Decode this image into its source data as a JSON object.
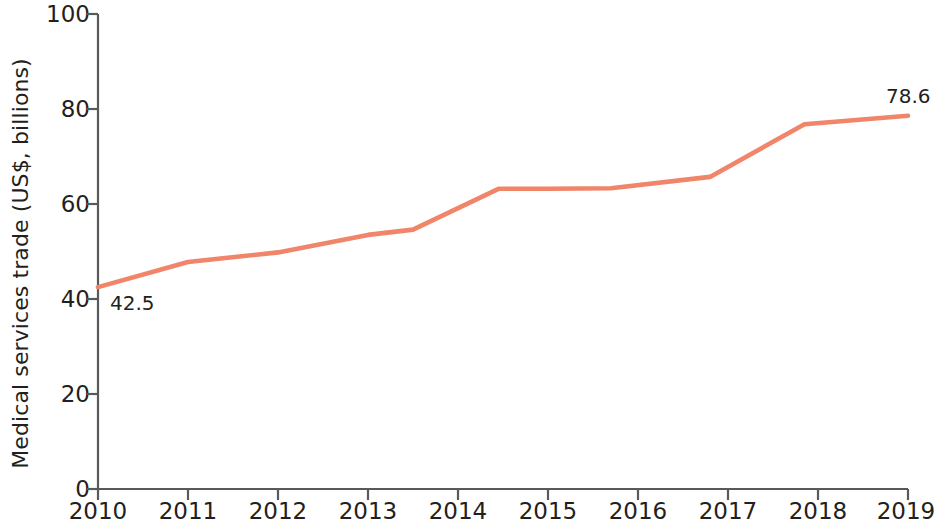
{
  "chart_data": {
    "type": "line",
    "title": "",
    "subtitle": "",
    "xlabel": "",
    "ylabel": "Medical services trade (US$, billions)",
    "x": [
      2010,
      2011,
      2012,
      2013,
      2014,
      2015,
      2016,
      2017,
      2018,
      2019
    ],
    "categories": [
      "2010",
      "2011",
      "2012",
      "2013",
      "2014",
      "2015",
      "2016",
      "2017",
      "2018",
      "2019"
    ],
    "values": [
      42.5,
      47.8,
      49.8,
      53.5,
      61.0,
      63.2,
      63.4,
      65.5,
      76.8,
      78.6
    ],
    "vertices": [
      {
        "x": 2010.0,
        "y": 42.5
      },
      {
        "x": 2011.0,
        "y": 47.8
      },
      {
        "x": 2012.0,
        "y": 49.8
      },
      {
        "x": 2013.0,
        "y": 53.5
      },
      {
        "x": 2013.5,
        "y": 54.6
      },
      {
        "x": 2014.45,
        "y": 63.2
      },
      {
        "x": 2015.0,
        "y": 63.2
      },
      {
        "x": 2015.7,
        "y": 63.3
      },
      {
        "x": 2016.8,
        "y": 65.7
      },
      {
        "x": 2017.85,
        "y": 76.8
      },
      {
        "x": 2019.0,
        "y": 78.6
      }
    ],
    "ylim": [
      0,
      100
    ],
    "xlim": [
      2010,
      2019
    ],
    "yticks": [
      0,
      20,
      40,
      60,
      80,
      100
    ],
    "ytick_labels": [
      "0",
      "20",
      "40",
      "60",
      "80",
      "100"
    ],
    "xticks": [
      2010,
      2011,
      2012,
      2013,
      2014,
      2015,
      2016,
      2017,
      2018,
      2019
    ],
    "xtick_labels": [
      "2010",
      "2011",
      "2012",
      "2013",
      "2014",
      "2015",
      "2016",
      "2017",
      "2018",
      "2019"
    ],
    "grid": false,
    "legend": null,
    "annotations": [
      {
        "text": "42.5",
        "x": 2010,
        "y": 42.5,
        "position": "below-right"
      },
      {
        "text": "78.6",
        "x": 2019,
        "y": 78.6,
        "position": "above-left"
      }
    ],
    "series_color": "#f0856a",
    "axis_color": "#58595b",
    "text_color": "#231f20"
  }
}
